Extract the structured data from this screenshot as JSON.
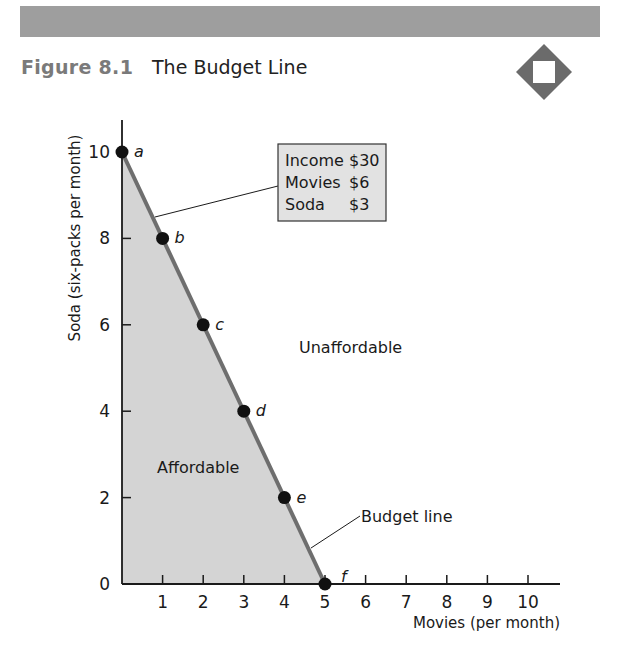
{
  "header": {
    "figure_number": "Figure 8.1",
    "figure_title": "The Budget Line",
    "badge_icon": "diamond-square-icon"
  },
  "colors": {
    "bar_gray": "#9e9e9e",
    "figure_number_gray": "#7a7a7a",
    "affordable_fill": "#d4d4d4",
    "budget_line": "#6e6e6e",
    "point": "#111111",
    "legend_box_fill": "#e2e2e2"
  },
  "legend_box": {
    "lines": [
      {
        "label": "Income",
        "value": "$30"
      },
      {
        "label": "Movies",
        "value": "$6"
      },
      {
        "label": "Soda",
        "value": "$3"
      }
    ]
  },
  "annotations": {
    "unaffordable": "Unaffordable",
    "affordable": "Affordable",
    "budget_line": "Budget line"
  },
  "chart_data": {
    "type": "line",
    "title": "The Budget Line",
    "xlabel": "Movies (per month)",
    "ylabel": "Soda (six-packs per month)",
    "xlim": [
      0,
      10
    ],
    "ylim": [
      0,
      10
    ],
    "x_ticks": [
      1,
      2,
      3,
      4,
      5,
      6,
      7,
      8,
      9,
      10
    ],
    "y_ticks": [
      0,
      2,
      4,
      6,
      8,
      10
    ],
    "origin_label": "0",
    "grid": false,
    "series": [
      {
        "name": "Budget line",
        "points": [
          {
            "label": "a",
            "x": 0,
            "y": 10
          },
          {
            "label": "b",
            "x": 1,
            "y": 8
          },
          {
            "label": "c",
            "x": 2,
            "y": 6
          },
          {
            "label": "d",
            "x": 3,
            "y": 4
          },
          {
            "label": "e",
            "x": 4,
            "y": 2
          },
          {
            "label": "f",
            "x": 5,
            "y": 0
          }
        ]
      }
    ],
    "regions": [
      {
        "name": "Affordable",
        "shaded": true
      },
      {
        "name": "Unaffordable",
        "shaded": false
      }
    ],
    "budget": {
      "income": 30,
      "price_movies": 6,
      "price_soda": 3
    }
  }
}
